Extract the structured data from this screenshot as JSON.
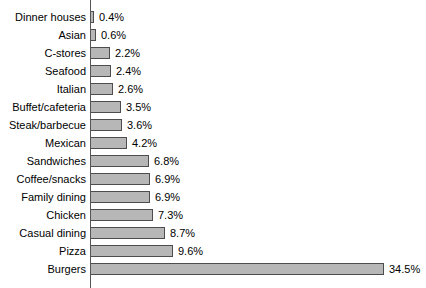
{
  "chart_data": {
    "type": "bar",
    "orientation": "horizontal",
    "title": "",
    "subtitle": "",
    "xlabel": "",
    "ylabel": "",
    "xlim": [
      0,
      34.5
    ],
    "grid": false,
    "legend": null,
    "axis_line": true,
    "value_label_suffix": "%",
    "categories": [
      "Dinner houses",
      "Asian",
      "C-stores",
      "Seafood",
      "Italian",
      "Buffet/cafeteria",
      "Steak/barbecue",
      "Mexican",
      "Sandwiches",
      "Coffee/snacks",
      "Family dining",
      "Chicken",
      "Casual dining",
      "Pizza",
      "Burgers"
    ],
    "values": [
      0.4,
      0.6,
      2.2,
      2.4,
      2.6,
      3.5,
      3.6,
      4.2,
      6.8,
      6.9,
      6.9,
      7.3,
      8.7,
      9.6,
      34.5
    ],
    "value_labels": [
      "0.4%",
      "0.6%",
      "2.2%",
      "2.4%",
      "2.6%",
      "3.5%",
      "3.6%",
      "4.2%",
      "6.8%",
      "6.9%",
      "6.9%",
      "7.3%",
      "8.7%",
      "9.6%",
      "34.5%"
    ],
    "colors": {
      "bar_fill": "#b7b7b7",
      "bar_border": "#4d4d4d",
      "axis": "#555555",
      "text": "#000000",
      "background": "#ffffff"
    },
    "px_per_unit": 8.5
  }
}
